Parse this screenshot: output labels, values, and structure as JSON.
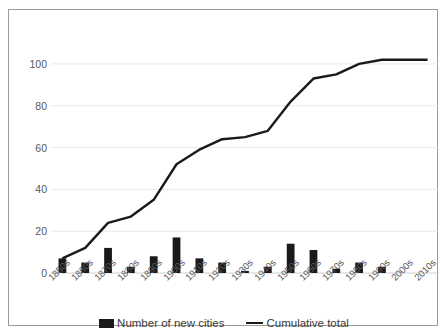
{
  "chart_data": {
    "type": "bar",
    "title": "",
    "subtitle": "",
    "xlabel": "",
    "ylabel": "",
    "ylim": [
      0,
      110
    ],
    "yticks": [
      0,
      20,
      40,
      60,
      80,
      100
    ],
    "grid": true,
    "legend_position": "bottom",
    "categories": [
      "1850s",
      "1860s",
      "1870s",
      "1880s",
      "1890s",
      "1900s",
      "1910s",
      "1920s",
      "1930s",
      "1940s",
      "1950s",
      "1960s",
      "1970s",
      "1980s",
      "1990s",
      "2000s",
      "2010s"
    ],
    "series": [
      {
        "name": "Number of new cities",
        "type": "bar",
        "color": "#1a1a1a",
        "values": [
          7,
          5,
          12,
          3,
          8,
          17,
          7,
          5,
          1,
          3,
          14,
          11,
          2,
          5,
          3,
          0,
          0
        ]
      },
      {
        "name": "Cumulative total",
        "type": "line",
        "color": "#1a1a1a",
        "values": [
          7,
          12,
          24,
          27,
          35,
          52,
          59,
          64,
          65,
          68,
          82,
          93,
          95,
          100,
          102,
          102,
          102
        ]
      }
    ]
  },
  "legend": {
    "entries": [
      {
        "label": "Number of new cities",
        "marker": "bar-swatch-icon"
      },
      {
        "label": "Cumulative total",
        "marker": "line-swatch-icon"
      }
    ]
  },
  "colors": {
    "series": "#1a1a1a",
    "gridline": "#e8e8e8",
    "axis_text": "#595959",
    "frame": "#9b9b9b",
    "background": "#ffffff"
  }
}
